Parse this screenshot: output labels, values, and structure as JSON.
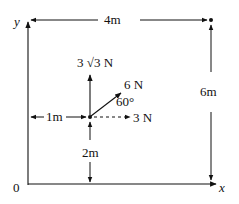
{
  "diagram": {
    "type": "force-diagram",
    "colors": {
      "ink": "#111111",
      "background": "#ffffff"
    },
    "axes": {
      "x_label": "x",
      "y_label": "y",
      "origin_label": "0"
    },
    "dimensions": {
      "top_width": "4m",
      "right_height": "6m",
      "left_offset": "1m",
      "bottom_offset": "2m"
    },
    "forces": {
      "vertical": "3 √3 N",
      "inclined": "6 N",
      "horizontal": "3 N",
      "angle": "60°"
    },
    "points": {
      "application_point": {
        "x_m": 1,
        "y_m": 2
      },
      "corner_point": {
        "x_m": 4,
        "y_m": 6
      }
    }
  }
}
